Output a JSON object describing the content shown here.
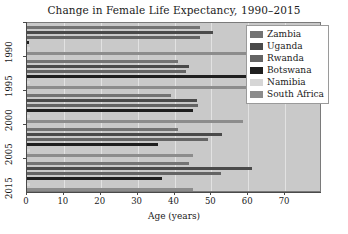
{
  "chart_data": {
    "type": "bar",
    "orientation": "horizontal",
    "title": "Change in Female Life Expectancy, 1990–2015",
    "xlabel": "Age (years)",
    "ylabel": "",
    "xlim": [
      0,
      80
    ],
    "ylim": [
      0,
      6
    ],
    "xticks": [
      0,
      10,
      20,
      30,
      40,
      50,
      60,
      70
    ],
    "xtick_labels": [
      "0",
      "10",
      "20",
      "30",
      "40",
      "50",
      "60",
      "70"
    ],
    "categories": [
      "1990",
      "1995",
      "2000",
      "2005",
      "2015"
    ],
    "grid": true,
    "grid_axis": "x",
    "legend_position": "upper right",
    "series": [
      {
        "name": "Zambia",
        "color": "#737373",
        "values": [
          47.0,
          41.0,
          39.0,
          41.0,
          44.0
        ]
      },
      {
        "name": "Uganda",
        "color": "#4a4a4a",
        "values": [
          50.5,
          44.0,
          46.0,
          53.0,
          61.0
        ]
      },
      {
        "name": "Rwanda",
        "color": "#646464",
        "values": [
          47.0,
          43.0,
          46.5,
          49.0,
          52.5
        ]
      },
      {
        "name": "Botswana",
        "color": "#1f1f1f",
        "values": [
          0.5,
          65.0,
          45.0,
          35.5,
          36.5
        ]
      },
      {
        "name": "Namibia",
        "color": "#d6d6d6",
        "values": [
          0.8,
          0.8,
          0.8,
          0.8,
          0.8
        ]
      },
      {
        "name": "South Africa",
        "color": "#8c8c8c",
        "values": [
          67.0,
          65.5,
          58.5,
          45.0,
          45.0
        ]
      }
    ]
  },
  "legend": {
    "items": [
      {
        "label": "Zambia",
        "color": "#737373"
      },
      {
        "label": "Uganda",
        "color": "#4a4a4a"
      },
      {
        "label": "Rwanda",
        "color": "#646464"
      },
      {
        "label": "Botswana",
        "color": "#1f1f1f"
      },
      {
        "label": "Namibia",
        "color": "#d6d6d6"
      },
      {
        "label": "South Africa",
        "color": "#8c8c8c"
      }
    ]
  },
  "style": {
    "plot_background": "#c9c9c9",
    "figure_background": "#ffffff",
    "grid_color": "#e2e2e2",
    "axis_color": "#4a4a4a",
    "text_color": "#1a1a1a"
  }
}
